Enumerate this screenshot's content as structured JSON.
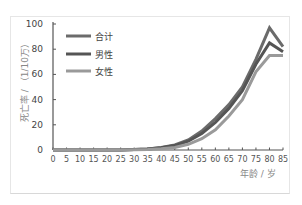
{
  "chart_data": {
    "type": "line",
    "title": "",
    "xlabel": "年龄 / 岁",
    "ylabel": "死亡率 / （1/10万）",
    "x": [
      0,
      5,
      10,
      15,
      20,
      25,
      30,
      35,
      40,
      45,
      50,
      55,
      60,
      65,
      70,
      75,
      80,
      85
    ],
    "series": [
      {
        "name": "合计",
        "color": "#6b6b6b",
        "values": [
          0,
          0,
          0,
          0,
          0,
          0,
          0.3,
          0.8,
          2,
          4,
          8,
          15,
          25,
          36,
          50,
          72,
          97,
          82
        ]
      },
      {
        "name": "男性",
        "color": "#555555",
        "values": [
          0,
          0,
          0,
          0,
          0,
          0,
          0.3,
          0.8,
          1.8,
          3.5,
          7,
          13,
          22,
          33,
          47,
          68,
          85,
          78
        ]
      },
      {
        "name": "女性",
        "color": "#9a9a9a",
        "values": [
          0,
          0,
          0,
          0,
          0,
          0,
          0.2,
          0.5,
          1,
          2,
          4.5,
          9,
          16,
          27,
          40,
          62,
          75,
          75
        ]
      }
    ],
    "ylim": [
      0,
      100
    ],
    "xlim": [
      0,
      85
    ],
    "yticks": [
      0,
      20,
      40,
      60,
      80,
      100
    ],
    "xticks": [
      0,
      5,
      10,
      15,
      20,
      25,
      30,
      35,
      40,
      45,
      50,
      55,
      60,
      65,
      70,
      75,
      80,
      85
    ],
    "grid": false,
    "legend_position": "upper-left"
  },
  "legend": {
    "items": [
      "合计",
      "男性",
      "女性"
    ]
  },
  "axes": {
    "xlabel": "年龄 / 岁",
    "ylabel": "死亡率 / （1/10万）"
  }
}
